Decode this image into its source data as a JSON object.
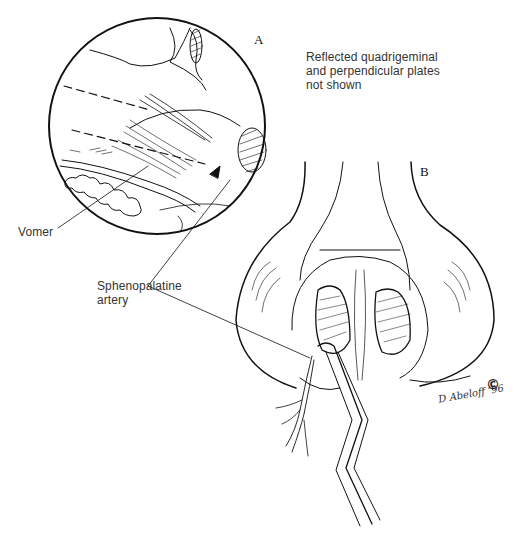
{
  "figure": {
    "panel_a_label": "A",
    "panel_b_label": "B",
    "note": {
      "line1": "Reflected quadrigeminal",
      "line2": "and perpendicular plates",
      "line3": "not shown"
    },
    "labels": {
      "vomer": "Vomer",
      "sphenopalatine_line1": "Sphenopalatine",
      "sphenopalatine_line2": "artery"
    },
    "signature": "D Abeloff ’96",
    "copyright": "©"
  }
}
